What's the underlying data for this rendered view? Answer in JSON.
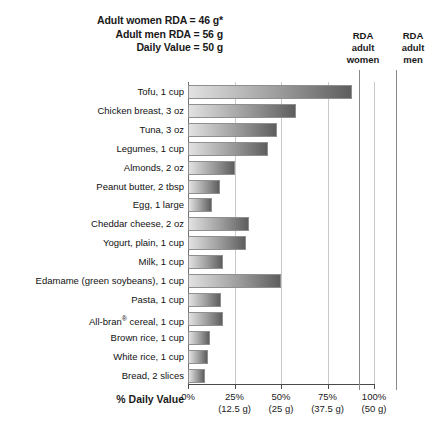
{
  "header": {
    "notes": [
      "Adult women RDA = 46 g*",
      "Adult men RDA = 56 g",
      "Daily Value = 50 g"
    ],
    "rda_women": {
      "line1": "RDA",
      "line2": "adult",
      "line3": "women"
    },
    "rda_men": {
      "line1": "RDA",
      "line2": "adult",
      "line3": "men"
    }
  },
  "axis": {
    "title": "% Daily Value",
    "ticks": [
      {
        "pct": "0%",
        "grams": ""
      },
      {
        "pct": "25%",
        "grams": "(12.5 g)"
      },
      {
        "pct": "50%",
        "grams": "(25 g)"
      },
      {
        "pct": "75%",
        "grams": "(37.5 g)"
      },
      {
        "pct": "100%",
        "grams": "(50 g)"
      }
    ]
  },
  "chart_data": {
    "type": "bar",
    "orientation": "horizontal",
    "xlabel": "% Daily Value",
    "ylabel": "",
    "xlim": [
      0,
      100
    ],
    "xticks": [
      0,
      25,
      50,
      75,
      100
    ],
    "xtick_labels": [
      "0%",
      "25%",
      "50%",
      "75%",
      "100%"
    ],
    "xtick_sublabels": [
      "",
      "(12.5 g)",
      "(25 g)",
      "(37.5 g)",
      "(50 g)"
    ],
    "grid": true,
    "legend": "none",
    "daily_value_grams": 50,
    "reference_lines": [
      {
        "label": "RDA adult women",
        "grams": 46,
        "percent": 92
      },
      {
        "label": "RDA adult men",
        "grams": 56,
        "percent": 112
      }
    ],
    "footnote": "*",
    "categories": [
      "Tofu, 1 cup",
      "Chicken breast, 3 oz",
      "Tuna, 3 oz",
      "Legumes, 1 cup",
      "Almonds, 2 oz",
      "Peanut butter, 2 tbsp",
      "Egg, 1 large",
      "Cheddar cheese, 2 oz",
      "Yogurt, plain, 1 cup",
      "Milk, 1 cup",
      "Edamame (green soybeans), 1 cup",
      "Pasta, 1 cup",
      "All-bran® cereal, 1 cup",
      "Brown rice, 1 cup",
      "White rice, 1 cup",
      "Bread, 2 slices"
    ],
    "values": [
      88,
      58,
      48,
      43,
      25,
      17,
      13,
      33,
      31,
      19,
      50,
      18,
      19,
      12,
      11,
      9
    ]
  }
}
